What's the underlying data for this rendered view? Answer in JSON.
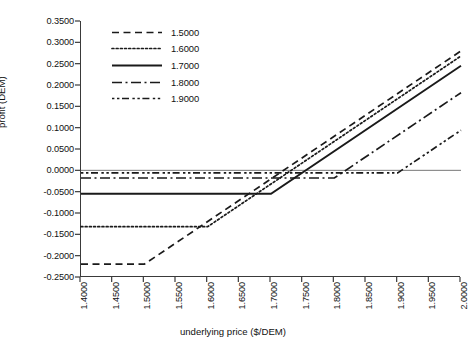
{
  "chart_data": {
    "type": "line",
    "title": "",
    "xlabel": "underlying price ($/DEM)",
    "ylabel": "profit (DEM)",
    "xlim": [
      1.4,
      2.0
    ],
    "ylim": [
      -0.25,
      0.35
    ],
    "grid": false,
    "legend_position": "top-left-inside",
    "x_ticks": [
      "1.4000",
      "1.4500",
      "1.5000",
      "1.5500",
      "1.6000",
      "1.6500",
      "1.7000",
      "1.7500",
      "1.8000",
      "1.8500",
      "1.9000",
      "1.9500",
      "2.0000"
    ],
    "x_tick_values": [
      1.4,
      1.45,
      1.5,
      1.55,
      1.6,
      1.65,
      1.7,
      1.75,
      1.8,
      1.85,
      1.9,
      1.95,
      2.0
    ],
    "y_ticks": [
      "0.3500",
      "0.3000",
      "0.2500",
      "0.2000",
      "0.1500",
      "0.1000",
      "0.0500",
      "0.0000",
      "-0.0500",
      "-0.1000",
      "-0.1500",
      "-0.2000",
      "-0.2500"
    ],
    "y_tick_values": [
      0.35,
      0.3,
      0.25,
      0.2,
      0.15,
      0.1,
      0.05,
      0.0,
      -0.05,
      -0.1,
      -0.15,
      -0.2,
      -0.25
    ],
    "zero_line": 0.0,
    "series": [
      {
        "name": "1.5000",
        "label": "1.5000",
        "style": "dashed",
        "strike": 1.5,
        "premium": -0.22,
        "x": [
          1.4,
          1.5,
          2.0
        ],
        "values": [
          -0.22,
          -0.22,
          0.28
        ]
      },
      {
        "name": "1.6000",
        "label": "1.6000",
        "style": "dotted",
        "strike": 1.6,
        "premium": -0.132,
        "x": [
          1.4,
          1.6,
          2.0
        ],
        "values": [
          -0.132,
          -0.132,
          0.268
        ]
      },
      {
        "name": "1.7000",
        "label": "1.7000",
        "style": "solid",
        "strike": 1.7,
        "premium": -0.055,
        "x": [
          1.4,
          1.7,
          2.0
        ],
        "values": [
          -0.055,
          -0.055,
          0.245
        ]
      },
      {
        "name": "1.8000",
        "label": "1.8000",
        "style": "dashdot",
        "strike": 1.8,
        "premium": -0.018,
        "x": [
          1.4,
          1.8,
          2.0
        ],
        "values": [
          -0.018,
          -0.018,
          0.182
        ]
      },
      {
        "name": "1.9000",
        "label": "1.9000",
        "style": "dashdotdot",
        "strike": 1.9,
        "premium": -0.006,
        "x": [
          1.4,
          1.9,
          2.0
        ],
        "values": [
          -0.006,
          -0.006,
          0.094
        ]
      }
    ]
  },
  "legend": {
    "items": [
      {
        "label": "1.5000"
      },
      {
        "label": "1.6000"
      },
      {
        "label": "1.7000"
      },
      {
        "label": "1.8000"
      },
      {
        "label": "1.9000"
      }
    ]
  },
  "colors": {
    "line": "#1a1a1a",
    "axis": "#3a3a3a",
    "zero": "#777777",
    "text": "#111111",
    "background": "#ffffff"
  }
}
